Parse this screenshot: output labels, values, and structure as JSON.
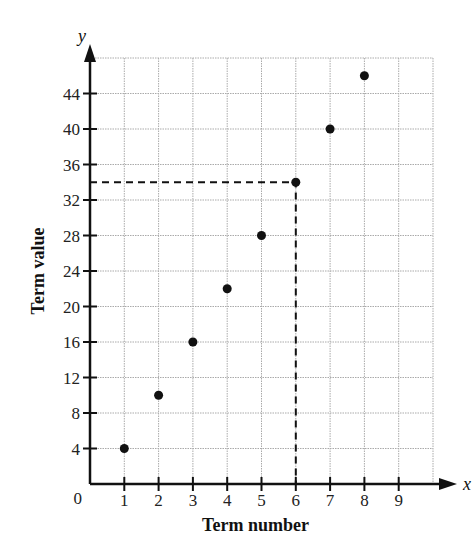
{
  "chart_data": {
    "type": "scatter",
    "title": "",
    "xlabel": "Term number",
    "ylabel": "Term value",
    "x_axis_variable": "x",
    "y_axis_variable": "y",
    "origin_label": "0",
    "x_ticks": [
      1,
      2,
      3,
      4,
      5,
      6,
      7,
      8,
      9
    ],
    "y_ticks": [
      4,
      8,
      12,
      16,
      20,
      24,
      28,
      32,
      36,
      40,
      44
    ],
    "xlim": [
      0,
      10
    ],
    "ylim": [
      0,
      48
    ],
    "grid": true,
    "legend": null,
    "series": [
      {
        "name": "terms",
        "x": [
          1,
          2,
          3,
          4,
          5,
          6,
          7,
          8
        ],
        "y": [
          4,
          10,
          16,
          22,
          28,
          34,
          40,
          46
        ]
      }
    ],
    "annotations": [
      {
        "type": "dashed-guide",
        "from_x": 6,
        "from_y": 34,
        "description": "Dashed lines from point (6, 34) to both axes"
      }
    ]
  }
}
